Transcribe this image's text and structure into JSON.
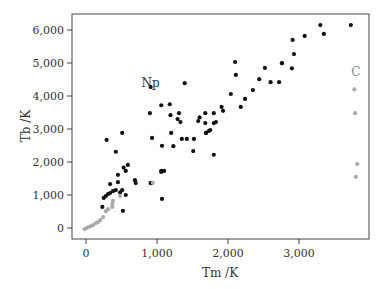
{
  "chart_data": {
    "type": "scatter",
    "title": "",
    "xlabel": "Tm /K",
    "ylabel": "Tb /K",
    "xlim": [
      -170,
      3970
    ],
    "ylim": [
      -330,
      6500
    ],
    "xticks": [
      0,
      1000,
      2000,
      3000
    ],
    "xtick_labels": [
      "0",
      "1,000",
      "2,000",
      "3,000"
    ],
    "yticks": [
      0,
      1000,
      2000,
      3000,
      4000,
      5000,
      6000
    ],
    "ytick_labels": [
      "0",
      "1,000",
      "2,000",
      "3,000",
      "4,000",
      "5,000",
      "6,000"
    ],
    "grid": false,
    "legend": null,
    "annotations": [
      {
        "text": "Np",
        "x": 910,
        "y": 4270,
        "color": "#333333"
      },
      {
        "text": "C",
        "x": 3800,
        "y": 4600,
        "color": "#888888"
      }
    ],
    "series": [
      {
        "name": "metals",
        "color": "#111111",
        "points": [
          [
            230,
            640
          ],
          [
            250,
            910
          ],
          [
            280,
            970
          ],
          [
            310,
            1030
          ],
          [
            340,
            1060
          ],
          [
            380,
            1120
          ],
          [
            510,
            1150
          ],
          [
            340,
            1330
          ],
          [
            520,
            520
          ],
          [
            420,
            1150
          ],
          [
            560,
            1000
          ],
          [
            480,
            1080
          ],
          [
            450,
            1390
          ],
          [
            700,
            1360
          ],
          [
            690,
            1450
          ],
          [
            920,
            1360
          ],
          [
            1070,
            880
          ],
          [
            1060,
            1730
          ],
          [
            290,
            2670
          ],
          [
            510,
            2880
          ],
          [
            420,
            2310
          ],
          [
            590,
            1910
          ],
          [
            530,
            1830
          ],
          [
            560,
            1730
          ],
          [
            450,
            1610
          ],
          [
            920,
            1360
          ],
          [
            910,
            4270
          ],
          [
            1390,
            4390
          ],
          [
            1060,
            3720
          ],
          [
            1180,
            3750
          ],
          [
            900,
            3480
          ],
          [
            1190,
            3420
          ],
          [
            1310,
            3480
          ],
          [
            1290,
            3300
          ],
          [
            1330,
            3210
          ],
          [
            1200,
            2880
          ],
          [
            1600,
            3350
          ],
          [
            1580,
            3240
          ],
          [
            1680,
            3480
          ],
          [
            1800,
            3180
          ],
          [
            1830,
            3210
          ],
          [
            1750,
            2970
          ],
          [
            1690,
            2880
          ],
          [
            1730,
            2940
          ],
          [
            1520,
            2700
          ],
          [
            1420,
            2700
          ],
          [
            1350,
            2700
          ],
          [
            930,
            2730
          ],
          [
            1230,
            2480
          ],
          [
            1070,
            2490
          ],
          [
            1510,
            2330
          ],
          [
            1800,
            2220
          ],
          [
            910,
            1360
          ],
          [
            1100,
            1730
          ],
          [
            1060,
            1700
          ],
          [
            1690,
            2880
          ],
          [
            2100,
            5030
          ],
          [
            2110,
            4640
          ],
          [
            2520,
            4850
          ],
          [
            2760,
            4990
          ],
          [
            2440,
            4510
          ],
          [
            2600,
            4420
          ],
          [
            2720,
            4420
          ],
          [
            2350,
            4180
          ],
          [
            2040,
            4060
          ],
          [
            2240,
            3910
          ],
          [
            1910,
            3670
          ],
          [
            1930,
            3550
          ],
          [
            2180,
            3670
          ],
          [
            1800,
            3480
          ],
          [
            1680,
            3180
          ],
          [
            3300,
            6150
          ],
          [
            3080,
            5820
          ],
          [
            2910,
            5700
          ],
          [
            2930,
            5270
          ],
          [
            2760,
            5000
          ],
          [
            2900,
            4840
          ],
          [
            3730,
            6150
          ],
          [
            3350,
            5880
          ]
        ]
      },
      {
        "name": "non-metals",
        "color": "#aaaaaa",
        "points": [
          [
            -20,
            -30
          ],
          [
            10,
            0
          ],
          [
            40,
            30
          ],
          [
            70,
            60
          ],
          [
            100,
            90
          ],
          [
            140,
            150
          ],
          [
            170,
            180
          ],
          [
            200,
            240
          ],
          [
            240,
            330
          ],
          [
            280,
            510
          ],
          [
            310,
            570
          ],
          [
            370,
            640
          ],
          [
            370,
            730
          ],
          [
            380,
            820
          ],
          [
            480,
            970
          ],
          [
            940,
            1370
          ],
          [
            3780,
            4200
          ],
          [
            3800,
            1550
          ],
          [
            3820,
            1940
          ],
          [
            3790,
            3480
          ]
        ]
      }
    ]
  }
}
